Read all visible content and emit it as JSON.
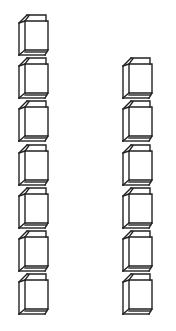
{
  "figure": {
    "background_color": "#ffffff",
    "stroke_color": "#222222",
    "stroke_width": 1.4
  },
  "columns": [
    {
      "name": "left-column",
      "x": 17,
      "count": 7,
      "cube_tops": [
        14,
        57,
        100,
        144,
        187,
        230,
        273
      ]
    },
    {
      "name": "right-column",
      "x": 121,
      "count": 6,
      "cube_tops": [
        57,
        100,
        144,
        187,
        230,
        273
      ]
    }
  ],
  "cube_shape": {
    "width": 36,
    "height": 42,
    "icon": "cube-icon"
  }
}
